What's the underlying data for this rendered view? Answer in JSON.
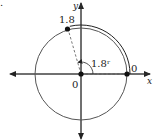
{
  "diagram": {
    "type": "unit-circle-arc",
    "corner_fragment": ".",
    "axes": {
      "x_label": "x",
      "y_label": "y"
    },
    "labels": {
      "origin": "0",
      "start_point": "0",
      "end_point": "1.8",
      "angle": "1.8ʳ"
    },
    "angle_radians": 1.8,
    "colors": {
      "circle": "#555555",
      "axes": "#333333",
      "arc": "#222222",
      "points": "#111111"
    }
  }
}
